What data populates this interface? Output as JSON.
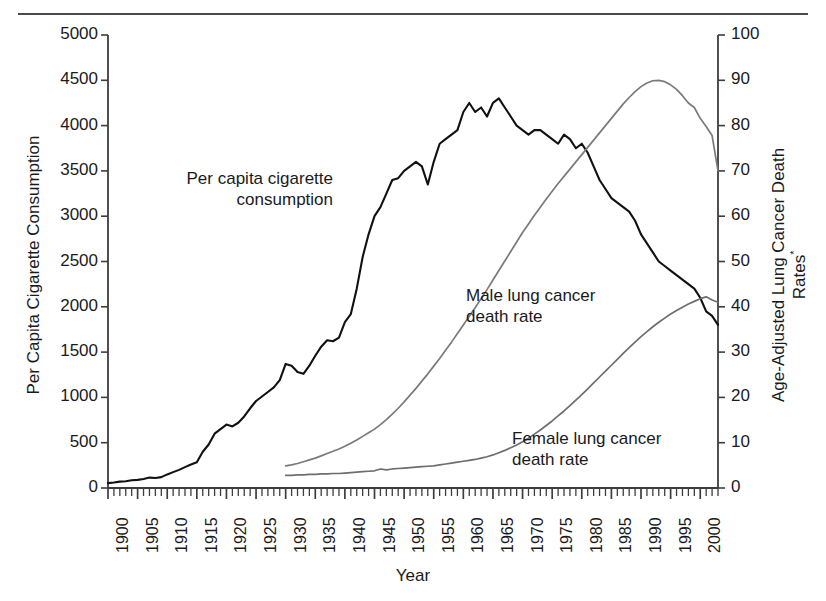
{
  "figure": {
    "has_top_rule": true,
    "background": "#ffffff",
    "line_colors": {
      "cigarette": "#111111",
      "male": "#7a7a7a",
      "female": "#6e6e6e",
      "axis": "#3d3d3d"
    }
  },
  "axes": {
    "left": {
      "title": "Per Capita Cigarette Consumption",
      "ticks": [
        "0",
        "500",
        "1000",
        "1500",
        "2000",
        "2500",
        "3000",
        "3500",
        "4000",
        "4500",
        "5000"
      ],
      "min": 0,
      "max": 5000
    },
    "right": {
      "title_line1": "Age-Adjusted Lung Cancer Death",
      "title_line2": "Rates",
      "title_superscript": "*",
      "ticks": [
        "0",
        "10",
        "20",
        "30",
        "40",
        "50",
        "60",
        "70",
        "80",
        "90",
        "100"
      ],
      "min": 0,
      "max": 100
    },
    "bottom": {
      "title": "Year",
      "ticks": [
        "1900",
        "1905",
        "1910",
        "1915",
        "1920",
        "1925",
        "1930",
        "1935",
        "1940",
        "1945",
        "1950",
        "1955",
        "1960",
        "1965",
        "1970",
        "1975",
        "1980",
        "1985",
        "1990",
        "1995",
        "2000"
      ],
      "min": 1900,
      "max": 2003
    }
  },
  "annotations": [
    {
      "id": "cigarette",
      "line1": "Per capita cigarette",
      "line2": "consumption"
    },
    {
      "id": "male",
      "line1": "Male lung cancer",
      "line2": "death rate"
    },
    {
      "id": "female",
      "line1": "Female lung cancer",
      "line2": "death rate"
    }
  ],
  "chart_data": {
    "type": "line",
    "title": "",
    "xlabel": "Year",
    "ylabel": "Per Capita Cigarette Consumption",
    "y2label": "Age-Adjusted Lung Cancer Death Rates*",
    "xlim": [
      1900,
      2003
    ],
    "ylim": [
      0,
      5000
    ],
    "y2lim": [
      0,
      100
    ],
    "grid": false,
    "legend": "inline-annotations",
    "series": [
      {
        "name": "Per capita cigarette consumption",
        "axis": "left",
        "color": "#111111",
        "x": [
          1900,
          1901,
          1902,
          1903,
          1904,
          1905,
          1906,
          1907,
          1908,
          1909,
          1910,
          1911,
          1912,
          1913,
          1914,
          1915,
          1916,
          1917,
          1918,
          1919,
          1920,
          1921,
          1922,
          1923,
          1924,
          1925,
          1926,
          1927,
          1928,
          1929,
          1930,
          1931,
          1932,
          1933,
          1934,
          1935,
          1936,
          1937,
          1938,
          1939,
          1940,
          1941,
          1942,
          1943,
          1944,
          1945,
          1946,
          1947,
          1948,
          1949,
          1950,
          1951,
          1952,
          1953,
          1954,
          1955,
          1956,
          1957,
          1958,
          1959,
          1960,
          1961,
          1962,
          1963,
          1964,
          1965,
          1966,
          1967,
          1968,
          1969,
          1970,
          1971,
          1972,
          1973,
          1974,
          1975,
          1976,
          1977,
          1978,
          1979,
          1980,
          1981,
          1982,
          1983,
          1984,
          1985,
          1986,
          1987,
          1988,
          1989,
          1990,
          1991,
          1992,
          1993,
          1994,
          1995,
          1996,
          1997,
          1998,
          1999,
          2000,
          2001,
          2002,
          2003
        ],
        "y": [
          54,
          60,
          70,
          75,
          85,
          90,
          100,
          115,
          110,
          120,
          150,
          175,
          200,
          230,
          260,
          285,
          400,
          480,
          600,
          650,
          700,
          680,
          720,
          790,
          880,
          960,
          1010,
          1060,
          1110,
          1190,
          1370,
          1350,
          1280,
          1260,
          1350,
          1460,
          1560,
          1630,
          1620,
          1660,
          1830,
          1920,
          2200,
          2550,
          2800,
          3000,
          3100,
          3250,
          3400,
          3420,
          3500,
          3550,
          3600,
          3550,
          3350,
          3600,
          3800,
          3850,
          3900,
          3950,
          4150,
          4250,
          4150,
          4200,
          4100,
          4250,
          4300,
          4200,
          4100,
          4000,
          3950,
          3900,
          3950,
          3950,
          3900,
          3850,
          3800,
          3900,
          3850,
          3750,
          3800,
          3700,
          3550,
          3400,
          3300,
          3200,
          3150,
          3100,
          3050,
          2950,
          2800,
          2700,
          2600,
          2500,
          2450,
          2400,
          2350,
          2300,
          2250,
          2200,
          2100,
          1950,
          1900,
          1800
        ]
      },
      {
        "name": "Male lung cancer death rate",
        "axis": "right",
        "color": "#7a7a7a",
        "x": [
          1930,
          1931,
          1932,
          1933,
          1934,
          1935,
          1936,
          1937,
          1938,
          1939,
          1940,
          1941,
          1942,
          1943,
          1944,
          1945,
          1946,
          1947,
          1948,
          1949,
          1950,
          1951,
          1952,
          1953,
          1954,
          1955,
          1956,
          1957,
          1958,
          1959,
          1960,
          1961,
          1962,
          1963,
          1964,
          1965,
          1966,
          1967,
          1968,
          1969,
          1970,
          1971,
          1972,
          1973,
          1974,
          1975,
          1976,
          1977,
          1978,
          1979,
          1980,
          1981,
          1982,
          1983,
          1984,
          1985,
          1986,
          1987,
          1988,
          1989,
          1990,
          1991,
          1992,
          1993,
          1994,
          1995,
          1996,
          1997,
          1998,
          1999,
          2000,
          2001,
          2002,
          2003
        ],
        "y": [
          4.9,
          5.1,
          5.4,
          5.8,
          6.2,
          6.6,
          7.1,
          7.6,
          8.1,
          8.6,
          9.2,
          9.9,
          10.6,
          11.4,
          12.2,
          13.0,
          14.0,
          15.1,
          16.3,
          17.6,
          19.0,
          20.5,
          22.0,
          23.6,
          25.2,
          26.9,
          28.6,
          30.4,
          32.2,
          34.1,
          36.0,
          37.9,
          39.8,
          41.8,
          43.8,
          45.9,
          48.0,
          50.1,
          52.2,
          54.3,
          56.4,
          58.3,
          60.2,
          62.0,
          63.8,
          65.5,
          67.2,
          68.8,
          70.4,
          72.0,
          73.6,
          75.2,
          76.8,
          78.4,
          80.0,
          81.6,
          83.2,
          84.8,
          86.2,
          87.5,
          88.6,
          89.4,
          89.9,
          90.0,
          89.7,
          89.0,
          88.0,
          86.6,
          85.0,
          84.0,
          81.6,
          79.8,
          77.8,
          70.0
        ]
      },
      {
        "name": "Female lung cancer death rate",
        "axis": "right",
        "color": "#6e6e6e",
        "x": [
          1930,
          1931,
          1932,
          1933,
          1934,
          1935,
          1936,
          1937,
          1938,
          1939,
          1940,
          1941,
          1942,
          1943,
          1944,
          1945,
          1946,
          1947,
          1948,
          1949,
          1950,
          1951,
          1952,
          1953,
          1954,
          1955,
          1956,
          1957,
          1958,
          1959,
          1960,
          1961,
          1962,
          1963,
          1964,
          1965,
          1966,
          1967,
          1968,
          1969,
          1970,
          1971,
          1972,
          1973,
          1974,
          1975,
          1976,
          1977,
          1978,
          1979,
          1980,
          1981,
          1982,
          1983,
          1984,
          1985,
          1986,
          1987,
          1988,
          1989,
          1990,
          1991,
          1992,
          1993,
          1994,
          1995,
          1996,
          1997,
          1998,
          1999,
          2000,
          2001,
          2002,
          2003
        ],
        "y": [
          2.8,
          2.8,
          2.9,
          2.9,
          3.0,
          3.0,
          3.1,
          3.1,
          3.2,
          3.2,
          3.3,
          3.4,
          3.5,
          3.6,
          3.7,
          3.8,
          4.2,
          4.0,
          4.2,
          4.3,
          4.4,
          4.5,
          4.6,
          4.7,
          4.8,
          4.9,
          5.1,
          5.3,
          5.5,
          5.7,
          5.9,
          6.1,
          6.3,
          6.6,
          6.9,
          7.3,
          7.8,
          8.3,
          8.9,
          9.5,
          10.2,
          11.0,
          11.9,
          12.8,
          13.8,
          14.8,
          15.9,
          17.0,
          18.2,
          19.4,
          20.6,
          21.9,
          23.2,
          24.5,
          25.8,
          27.1,
          28.4,
          29.7,
          31.0,
          32.2,
          33.4,
          34.5,
          35.6,
          36.6,
          37.5,
          38.4,
          39.2,
          39.9,
          40.6,
          41.2,
          41.8,
          42.2,
          41.5,
          41.0
        ]
      }
    ]
  }
}
